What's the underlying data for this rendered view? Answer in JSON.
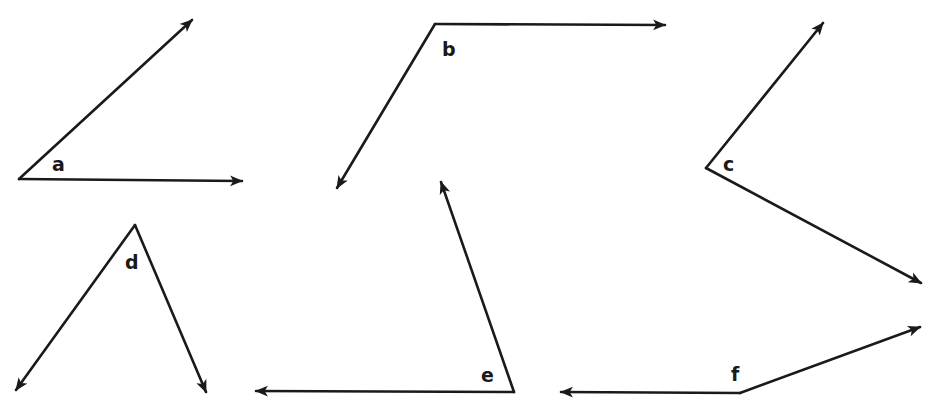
{
  "diagram": {
    "title": "",
    "stroke_color": "#1a1a1a",
    "background": "#ffffff",
    "angles": [
      {
        "label": "a",
        "vertex": [
          19,
          179
        ],
        "ray1_end": [
          192,
          20
        ],
        "ray2_end": [
          242,
          181
        ],
        "label_pos": [
          52,
          155
        ]
      },
      {
        "label": "b",
        "vertex": [
          435,
          24
        ],
        "ray1_end": [
          665,
          25
        ],
        "ray2_end": [
          337,
          188
        ],
        "label_pos": [
          442,
          40
        ]
      },
      {
        "label": "c",
        "vertex": [
          706,
          168
        ],
        "ray1_end": [
          823,
          23
        ],
        "ray2_end": [
          921,
          283
        ],
        "label_pos": [
          723,
          155
        ]
      },
      {
        "label": "d",
        "vertex": [
          135,
          225
        ],
        "ray1_end": [
          16,
          390
        ],
        "ray2_end": [
          206,
          392
        ],
        "label_pos": [
          125,
          253
        ]
      },
      {
        "label": "e",
        "vertex": [
          514,
          392
        ],
        "ray1_end": [
          441,
          182
        ],
        "ray2_end": [
          256,
          391
        ],
        "label_pos": [
          481,
          366
        ]
      },
      {
        "label": "f",
        "vertex": [
          740,
          393
        ],
        "ray1_end": [
          920,
          327
        ],
        "ray2_end": [
          561,
          392
        ],
        "label_pos": [
          731,
          365
        ]
      }
    ]
  }
}
